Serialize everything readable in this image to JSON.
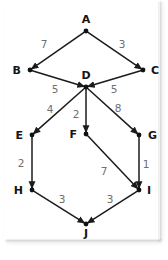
{
  "diagram": {
    "type": "directed-weighted-graph",
    "title": "",
    "nodes": [
      {
        "id": "A",
        "label": "A",
        "x": 86,
        "y": 31,
        "label_dx": 0,
        "label_dy": -8
      },
      {
        "id": "B",
        "label": "B",
        "x": 30,
        "y": 70,
        "label_dx": -9,
        "label_dy": 4
      },
      {
        "id": "C",
        "label": "C",
        "x": 143,
        "y": 70,
        "label_dx": 8,
        "label_dy": 4
      },
      {
        "id": "D",
        "label": "D",
        "x": 86,
        "y": 87,
        "label_dx": 0,
        "label_dy": -8
      },
      {
        "id": "E",
        "label": "E",
        "x": 32,
        "y": 135,
        "label_dx": -9,
        "label_dy": 4
      },
      {
        "id": "F",
        "label": "F",
        "x": 86,
        "y": 134,
        "label_dx": -9,
        "label_dy": 4
      },
      {
        "id": "G",
        "label": "G",
        "x": 139,
        "y": 135,
        "label_dx": 9,
        "label_dy": 4
      },
      {
        "id": "H",
        "label": "H",
        "x": 32,
        "y": 190,
        "label_dx": -9,
        "label_dy": 4
      },
      {
        "id": "I",
        "label": "I",
        "x": 139,
        "y": 190,
        "label_dx": 8,
        "label_dy": 4
      },
      {
        "id": "J",
        "label": "J",
        "x": 86,
        "y": 224,
        "label_dx": 0,
        "label_dy": 13
      }
    ],
    "edges": [
      {
        "from": "A",
        "to": "B",
        "weight": "7",
        "label_x": 44,
        "label_y": 48
      },
      {
        "from": "A",
        "to": "C",
        "weight": "3",
        "label_x": 122,
        "label_y": 48
      },
      {
        "from": "B",
        "to": "D",
        "weight": "5",
        "label_x": 55,
        "label_y": 93
      },
      {
        "from": "C",
        "to": "D",
        "weight": "5",
        "label_x": 114,
        "label_y": 93
      },
      {
        "from": "D",
        "to": "E",
        "weight": "4",
        "label_x": 50,
        "label_y": 113
      },
      {
        "from": "D",
        "to": "F",
        "weight": "2",
        "label_x": 76,
        "label_y": 118
      },
      {
        "from": "D",
        "to": "G",
        "weight": "8",
        "label_x": 118,
        "label_y": 112
      },
      {
        "from": "E",
        "to": "H",
        "weight": "2",
        "label_x": 21,
        "label_y": 167
      },
      {
        "from": "F",
        "to": "I",
        "weight": "7",
        "label_x": 104,
        "label_y": 175
      },
      {
        "from": "G",
        "to": "I",
        "weight": "1",
        "label_x": 146,
        "label_y": 168
      },
      {
        "from": "H",
        "to": "J",
        "weight": "3",
        "label_x": 62,
        "label_y": 203
      },
      {
        "from": "I",
        "to": "J",
        "weight": "3",
        "label_x": 110,
        "label_y": 203
      }
    ],
    "colors": {
      "background": "#ffffff",
      "edge": "#1b1b1b",
      "node": "#111111",
      "node_label": "#141414",
      "weight_label": "#6e6e6e"
    }
  }
}
